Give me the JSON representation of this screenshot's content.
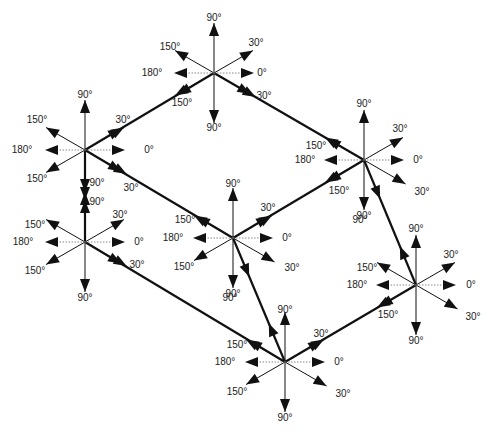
{
  "diagram": {
    "colors": {
      "stroke": "#111111",
      "dotted": "#888888",
      "label": "#222222",
      "background": "#ffffff"
    },
    "nodes": [
      {
        "id": "top",
        "x": 214,
        "y": 73
      },
      {
        "id": "upper-left",
        "x": 85,
        "y": 150
      },
      {
        "id": "lower-left",
        "x": 85,
        "y": 242
      },
      {
        "id": "center",
        "x": 233,
        "y": 238
      },
      {
        "id": "right",
        "x": 364,
        "y": 160
      },
      {
        "id": "bottom-right",
        "x": 416,
        "y": 285
      },
      {
        "id": "bottom",
        "x": 285,
        "y": 362
      }
    ],
    "edges": [
      {
        "from": "upper-left",
        "to": "top"
      },
      {
        "from": "top",
        "to": "right"
      },
      {
        "from": "upper-left",
        "to": "center"
      },
      {
        "from": "center",
        "to": "right"
      },
      {
        "from": "upper-left",
        "to": "lower-left"
      },
      {
        "from": "lower-left",
        "to": "bottom"
      },
      {
        "from": "center",
        "to": "bottom"
      },
      {
        "from": "right",
        "to": "bottom-right"
      },
      {
        "from": "bottom",
        "to": "bottom-right"
      }
    ],
    "labels": [
      {
        "node": "top",
        "items": [
          {
            "text": "90°",
            "dx": 0,
            "dy": -55
          },
          {
            "text": "30°",
            "dx": 42,
            "dy": -30
          },
          {
            "text": "150°",
            "dx": -44,
            "dy": -26
          },
          {
            "text": "180°",
            "dx": -62,
            "dy": 0
          },
          {
            "text": "0°",
            "dx": 48,
            "dy": 0
          },
          {
            "text": "150°",
            "dx": -32,
            "dy": 30
          },
          {
            "text": "30°",
            "dx": 50,
            "dy": 23
          },
          {
            "text": "90°",
            "dx": 0,
            "dy": 55
          }
        ]
      },
      {
        "node": "upper-left",
        "items": [
          {
            "text": "90°",
            "dx": 0,
            "dy": -55
          },
          {
            "text": "30°",
            "dx": 38,
            "dy": -30
          },
          {
            "text": "150°",
            "dx": -48,
            "dy": -30
          },
          {
            "text": "180°",
            "dx": -63,
            "dy": 0
          },
          {
            "text": "0°",
            "dx": 64,
            "dy": 0
          },
          {
            "text": "150°",
            "dx": -48,
            "dy": 29
          },
          {
            "text": "90°",
            "dx": 12,
            "dy": 33
          },
          {
            "text": "30°",
            "dx": 46,
            "dy": 38
          }
        ]
      },
      {
        "node": "lower-left",
        "items": [
          {
            "text": "90°",
            "dx": 12,
            "dy": -40
          },
          {
            "text": "30°",
            "dx": 35,
            "dy": -27
          },
          {
            "text": "150°",
            "dx": -50,
            "dy": -17
          },
          {
            "text": "180°",
            "dx": -62,
            "dy": 0
          },
          {
            "text": "0°",
            "dx": 54,
            "dy": 0
          },
          {
            "text": "150°",
            "dx": -50,
            "dy": 29
          },
          {
            "text": "30°",
            "dx": 52,
            "dy": 23
          },
          {
            "text": "90°",
            "dx": 0,
            "dy": 56
          }
        ]
      },
      {
        "node": "center",
        "items": [
          {
            "text": "90°",
            "dx": 0,
            "dy": -54
          },
          {
            "text": "30°",
            "dx": 35,
            "dy": -30
          },
          {
            "text": "150°",
            "dx": -48,
            "dy": -18
          },
          {
            "text": "180°",
            "dx": -60,
            "dy": 0
          },
          {
            "text": "0°",
            "dx": 54,
            "dy": 0
          },
          {
            "text": "150°",
            "dx": -49,
            "dy": 29
          },
          {
            "text": "30°",
            "dx": 59,
            "dy": 30
          },
          {
            "text": "90°",
            "dx": 0,
            "dy": 56
          }
        ]
      },
      {
        "node": "right",
        "items": [
          {
            "text": "90°",
            "dx": 0,
            "dy": -56
          },
          {
            "text": "30°",
            "dx": 36,
            "dy": -31
          },
          {
            "text": "150°",
            "dx": -48,
            "dy": -14
          },
          {
            "text": "180°",
            "dx": -59,
            "dy": 0
          },
          {
            "text": "0°",
            "dx": 54,
            "dy": 0
          },
          {
            "text": "150°",
            "dx": -25,
            "dy": 31
          },
          {
            "text": "30°",
            "dx": 58,
            "dy": 32
          },
          {
            "text": "90°",
            "dx": 0,
            "dy": 56
          }
        ]
      },
      {
        "node": "bottom-right",
        "items": [
          {
            "text": "90°",
            "dx": -56,
            "dy": -65
          },
          {
            "text": "90°",
            "dx": 0,
            "dy": -56
          },
          {
            "text": "30°",
            "dx": 35,
            "dy": -30
          },
          {
            "text": "150°",
            "dx": -49,
            "dy": -17
          },
          {
            "text": "180°",
            "dx": -59,
            "dy": 0
          },
          {
            "text": "0°",
            "dx": 55,
            "dy": 0
          },
          {
            "text": "150°",
            "dx": -28,
            "dy": 30
          },
          {
            "text": "30°",
            "dx": 57,
            "dy": 32
          },
          {
            "text": "90°",
            "dx": 0,
            "dy": 56
          }
        ]
      },
      {
        "node": "bottom",
        "items": [
          {
            "text": "90°",
            "dx": -55,
            "dy": -64
          },
          {
            "text": "90°",
            "dx": 0,
            "dy": -52
          },
          {
            "text": "30°",
            "dx": 36,
            "dy": -28
          },
          {
            "text": "150°",
            "dx": -48,
            "dy": -17
          },
          {
            "text": "180°",
            "dx": -60,
            "dy": 0
          },
          {
            "text": "0°",
            "dx": 54,
            "dy": 0
          },
          {
            "text": "150°",
            "dx": -48,
            "dy": 30
          },
          {
            "text": "30°",
            "dx": 58,
            "dy": 32
          },
          {
            "text": "90°",
            "dx": 0,
            "dy": 56
          }
        ]
      }
    ]
  }
}
